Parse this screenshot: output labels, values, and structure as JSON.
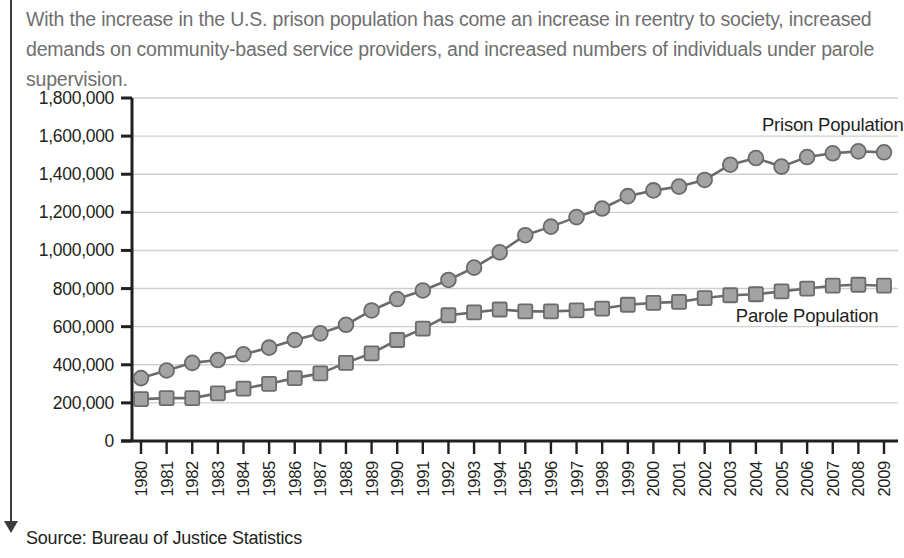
{
  "intro": {
    "text": "With the increase in the U.S. prison population has come an increase in reentry to society, increased demands on community-based service providers, and increased numbers of individuals under parole supervision."
  },
  "source": {
    "text": "Source: Bureau of Justice Statistics"
  },
  "colors": {
    "marker_fill": "#a3a3a3",
    "marker_stroke": "#6b6b6b",
    "line": "#6b6b6b",
    "gridline": "#cfcfcf",
    "axis": "#231f20",
    "intro_text": "#6f6f6f",
    "rule": "#3c3a3b"
  },
  "chart_data": {
    "type": "line",
    "title": "",
    "xlabel": "",
    "ylabel": "",
    "ylim": [
      0,
      1800000
    ],
    "ytick_step": 200000,
    "ytick_labels": [
      "0",
      "200,000",
      "400,000",
      "600,000",
      "800,000",
      "1,000,000",
      "1,200,000",
      "1,400,000",
      "1,600,000",
      "1,800,000"
    ],
    "grid": true,
    "legend_position": "inline-right",
    "categories": [
      "1980",
      "1981",
      "1982",
      "1983",
      "1984",
      "1985",
      "1986",
      "1987",
      "1988",
      "1989",
      "1990",
      "1991",
      "1992",
      "1993",
      "1994",
      "1995",
      "1996",
      "1997",
      "1998",
      "1999",
      "2000",
      "2001",
      "2002",
      "2003",
      "2004",
      "2005",
      "2006",
      "2007",
      "2008",
      "2009"
    ],
    "series": [
      {
        "name": "Prison Population",
        "marker": "circle",
        "label_x_year": "2007",
        "values": [
          330000,
          370000,
          410000,
          425000,
          455000,
          490000,
          530000,
          565000,
          610000,
          685000,
          745000,
          790000,
          845000,
          910000,
          990000,
          1080000,
          1125000,
          1175000,
          1220000,
          1285000,
          1315000,
          1335000,
          1370000,
          1450000,
          1485000,
          1440000,
          1490000,
          1510000,
          1520000,
          1515000
        ]
      },
      {
        "name": "Parole Population",
        "marker": "square",
        "label_x_year": "2006",
        "values": [
          220000,
          225000,
          225000,
          250000,
          275000,
          300000,
          330000,
          355000,
          410000,
          460000,
          530000,
          590000,
          660000,
          675000,
          690000,
          680000,
          680000,
          685000,
          695000,
          715000,
          725000,
          730000,
          750000,
          765000,
          770000,
          785000,
          800000,
          815000,
          820000,
          815000
        ]
      }
    ]
  }
}
